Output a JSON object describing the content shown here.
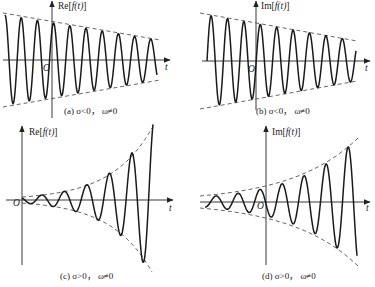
{
  "figure": {
    "panels": [
      {
        "id": "a",
        "axis_label_prefix": "Re[",
        "axis_label_func": "f",
        "axis_label_arg": "(t)",
        "axis_label_suffix": "]",
        "origin_label": "O",
        "t_label": "t",
        "caption": "(a) σ<0， ω≠0",
        "origin": [
          52,
          60
        ],
        "x_axis": [
          3,
          170
        ],
        "y_axis": [
          1,
          118
        ],
        "wave": {
          "x_start": 5,
          "x_end": 157,
          "period": 16.2,
          "phase_x": 5,
          "func": "cos",
          "amp_start": 45,
          "amp_end": 20
        },
        "envelope": {
          "x_start": 3,
          "x_end": 160,
          "amp_start": 47,
          "amp_end": 20
        },
        "label_pos": [
          58,
          2
        ],
        "origin_pos": [
          43,
          64
        ],
        "t_pos": [
          165,
          63
        ],
        "caption_pos": [
          64,
          107
        ]
      },
      {
        "id": "b",
        "axis_label_prefix": "Im[",
        "axis_label_func": "f",
        "axis_label_arg": "(t)",
        "axis_label_suffix": "]",
        "origin_label": "O",
        "t_label": "t",
        "caption": "(b) σ<0， ω≠0",
        "origin": [
          256,
          61
        ],
        "x_axis": [
          202,
          370
        ],
        "y_axis": [
          1,
          110
        ],
        "wave": {
          "x_start": 207,
          "x_end": 356,
          "period": 16.4,
          "phase_x": 207,
          "func": "sin",
          "amp_start": 46,
          "amp_end": 20
        },
        "envelope": {
          "x_start": 200,
          "x_end": 357,
          "amp_start": 48,
          "amp_end": 20
        },
        "label_pos": [
          261,
          2
        ],
        "origin_pos": [
          248,
          65
        ],
        "t_pos": [
          365,
          64
        ],
        "caption_pos": [
          256,
          107
        ]
      },
      {
        "id": "c",
        "axis_label_prefix": "Re[",
        "axis_label_func": "f",
        "axis_label_arg": "(t)",
        "axis_label_suffix": "]",
        "origin_label": "O",
        "t_label": "t",
        "caption": "(c) σ>0， ω≠0",
        "origin": [
          22,
          200
        ],
        "x_axis": [
          6,
          173
        ],
        "y_axis": [
          126,
          265
        ],
        "wave": {
          "x_start": 22,
          "x_end": 153,
          "period": 22.5,
          "phase_x": 22,
          "func": "negsin_shift",
          "amp_start": 3,
          "amp_end": 80
        },
        "envelope": {
          "x_start": 22,
          "x_end": 152,
          "amp_start": 3,
          "amp_end": 72
        },
        "label_pos": [
          29,
          128
        ],
        "origin_pos": [
          13,
          199
        ],
        "t_pos": [
          169,
          204
        ],
        "caption_pos": [
          60,
          272
        ]
      },
      {
        "id": "d",
        "axis_label_prefix": "Im[",
        "axis_label_func": "f",
        "axis_label_arg": "(t)",
        "axis_label_suffix": "]",
        "origin_label": "O",
        "t_label": "t",
        "caption": "(d) σ>0， ω≠0",
        "origin": [
          266,
          202
        ],
        "x_axis": [
          200,
          370
        ],
        "y_axis": [
          126,
          265
        ],
        "wave": {
          "x_start": 205,
          "x_end": 357,
          "period": 22,
          "phase_x": 205,
          "func": "sin_neg",
          "amp_start": 5,
          "amp_end": 64
        },
        "envelope": {
          "x_start": 200,
          "x_end": 358,
          "amp_start": 6,
          "amp_end": 64
        },
        "label_pos": [
          272,
          128
        ],
        "origin_pos": [
          257,
          202
        ],
        "t_pos": [
          366,
          204
        ],
        "caption_pos": [
          262,
          272
        ]
      }
    ]
  }
}
